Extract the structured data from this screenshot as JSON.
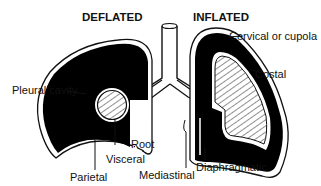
{
  "diagram": {
    "headings": {
      "left": "DEFLATED",
      "right": "INFLATED"
    },
    "labels": {
      "pleural_cavity": "Pleural cavity",
      "cervical": "Cervical or cupola",
      "costal": "Costal",
      "root": "Root",
      "visceral": "Visceral",
      "parietal": "Parietal",
      "mediastinal": "Mediastinal",
      "diaphragmatic": "Diaphragmatic"
    },
    "colors": {
      "pleural_fill": "#000000",
      "outline": "#111111",
      "background": "#ffffff"
    }
  }
}
